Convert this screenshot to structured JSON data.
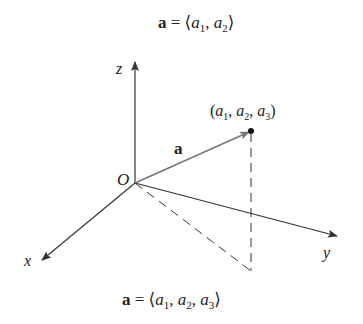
{
  "diagram": {
    "top_caption": {
      "bold": "a",
      "eq": " = ⟨",
      "v1": "a",
      "s1": "1",
      "comma1": ", ",
      "v2": "a",
      "s2": "2",
      "close": "⟩"
    },
    "bottom_caption": {
      "bold": "a",
      "eq": " = ⟨",
      "v1": "a",
      "s1": "1",
      "comma1": ", ",
      "v2": "a",
      "s2": "2",
      "comma2": ", ",
      "v3": "a",
      "s3": "3",
      "close": "⟩"
    },
    "axes": {
      "x_label": "x",
      "y_label": "y",
      "z_label": "z",
      "origin_label": "O"
    },
    "vector_label": "a",
    "point_label": {
      "open": "(",
      "v1": "a",
      "s1": "1",
      "c1": ", ",
      "v2": "a",
      "s2": "2",
      "c2": ", ",
      "v3": "a",
      "s3": "3",
      "close": ")"
    },
    "colors": {
      "axis": "#333333",
      "vector": "#777777",
      "text": "#222222"
    }
  }
}
